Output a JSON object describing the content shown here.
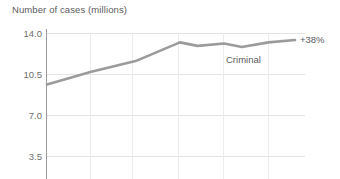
{
  "chart_data": {
    "type": "line",
    "title": "Number of cases (millions)",
    "xlabel": "",
    "ylabel": "Number of cases (millions)",
    "ylim": [
      3.5,
      14.0
    ],
    "yticks": [
      "14.0",
      "10.5",
      "7.0",
      "3.5"
    ],
    "ytick_values": [
      14.0,
      10.5,
      7.0,
      3.5
    ],
    "grid": true,
    "legend_position": "inline-right",
    "xtick_labels": [],
    "vertical_gridline_count": 5,
    "series": [
      {
        "name": "Criminal",
        "label": "Criminal",
        "color": "#9b9b9b",
        "x": [
          0,
          1,
          2,
          3,
          3.4,
          4,
          4.4,
          5,
          5.6
        ],
        "values": [
          9.6,
          10.7,
          11.6,
          13.2,
          12.9,
          13.1,
          12.8,
          13.2,
          13.4
        ],
        "end_annotation": "+38%",
        "change_pct": 38
      }
    ]
  },
  "axis": {
    "title": "Number of cases (millions)",
    "y_ticks": [
      {
        "label": "14.0"
      },
      {
        "label": "10.5"
      },
      {
        "label": "7.0"
      },
      {
        "label": "3.5"
      }
    ]
  },
  "annotations": {
    "series_label": "Criminal",
    "growth_label": "+38%"
  },
  "colors": {
    "line": "#9b9b9b",
    "gridline": "#e4e4e4",
    "vertical_gridline": "#ececec",
    "axis": "#9a9a9a",
    "text": "#5b5b5b",
    "tick_text": "#6e6e6e",
    "background": "#ffffff"
  }
}
